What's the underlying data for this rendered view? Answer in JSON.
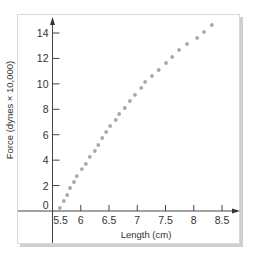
{
  "chart_data": {
    "type": "scatter",
    "title": "",
    "xlabel": "Length (cm)",
    "ylabel": "Force (dynes × 10,000)",
    "xlim": [
      5.5,
      8.6
    ],
    "ylim": [
      0,
      15
    ],
    "grid": false,
    "legend": null,
    "x_ticks": [
      "5.5",
      "6",
      "6.5",
      "7",
      "7.5",
      "8",
      "8.5"
    ],
    "y_ticks": [
      "0",
      "2",
      "4",
      "6",
      "8",
      "10",
      "12",
      "14"
    ],
    "marker_color": "#a8a8a8",
    "series": [
      {
        "name": "Force vs Length",
        "points": [
          [
            5.63,
            0.24
          ],
          [
            5.7,
            0.79
          ],
          [
            5.76,
            1.26
          ],
          [
            5.81,
            1.81
          ],
          [
            5.88,
            2.28
          ],
          [
            5.93,
            2.75
          ],
          [
            6.02,
            3.3
          ],
          [
            6.09,
            3.7
          ],
          [
            6.16,
            4.25
          ],
          [
            6.25,
            4.72
          ],
          [
            6.31,
            5.19
          ],
          [
            6.38,
            5.74
          ],
          [
            6.45,
            6.22
          ],
          [
            6.52,
            6.69
          ],
          [
            6.62,
            7.16
          ],
          [
            6.68,
            7.63
          ],
          [
            6.78,
            8.1
          ],
          [
            6.87,
            8.65
          ],
          [
            6.96,
            9.13
          ],
          [
            7.07,
            9.68
          ],
          [
            7.14,
            10.15
          ],
          [
            7.26,
            10.62
          ],
          [
            7.38,
            11.09
          ],
          [
            7.51,
            11.64
          ],
          [
            7.62,
            12.12
          ],
          [
            7.74,
            12.67
          ],
          [
            7.88,
            13.14
          ],
          [
            8.06,
            13.61
          ],
          [
            8.18,
            14.08
          ],
          [
            8.32,
            14.63
          ]
        ]
      }
    ]
  }
}
